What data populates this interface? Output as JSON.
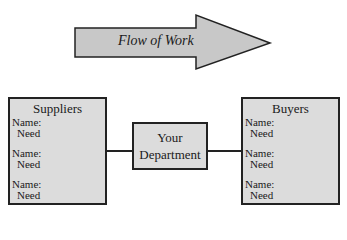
{
  "arrow": {
    "label": "Flow of Work",
    "fill": "#c8c8c8",
    "stroke": "#222222"
  },
  "suppliers": {
    "title": "Suppliers",
    "entries": [
      {
        "name": "Name:",
        "need": "Need"
      },
      {
        "name": "Name:",
        "need": "Need"
      },
      {
        "name": "Name:",
        "need": "Need"
      }
    ]
  },
  "department": {
    "line1": "Your",
    "line2": "Department"
  },
  "buyers": {
    "title": "Buyers",
    "entries": [
      {
        "name": "Name:",
        "need": "Need"
      },
      {
        "name": "Name:",
        "need": "Need"
      },
      {
        "name": "Name:",
        "need": "Need"
      }
    ]
  },
  "colors": {
    "box_fill": "#dcdcdc",
    "border": "#222222"
  }
}
